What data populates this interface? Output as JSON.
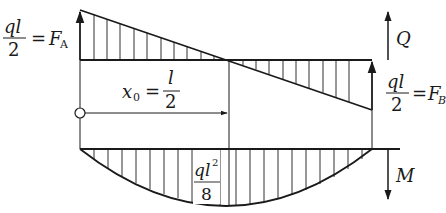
{
  "diagram": {
    "type": "shear-force-and-bending-moment-diagram",
    "left_reaction": {
      "numerator": "ql",
      "denominator": "2",
      "equals": "=",
      "symbol": "F",
      "subscript": "A"
    },
    "right_reaction": {
      "numerator": "ql",
      "denominator": "2",
      "equals": "=",
      "symbol": "F",
      "subscript": "B"
    },
    "position": {
      "symbol": "x",
      "subscript": "0",
      "equals": "=",
      "numerator": "l",
      "denominator": "2"
    },
    "max_moment": {
      "numerator_base": "ql",
      "numerator_exp": "2",
      "denominator": "8"
    },
    "shear_axis_label": "Q",
    "moment_axis_label": "M",
    "colors": {
      "line": "#1a1a1a",
      "background": "#ffffff"
    }
  }
}
